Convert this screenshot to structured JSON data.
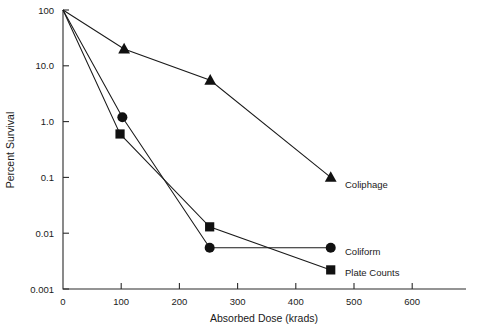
{
  "chart_data": {
    "type": "line",
    "title": "",
    "xlabel": "Absorbed Dose (krads)",
    "ylabel": "Percent Survival",
    "xlim": [
      0,
      650
    ],
    "ylim": [
      0.001,
      100
    ],
    "yscale": "log",
    "xscale": "linear",
    "grid": false,
    "legend": "inline-right",
    "xticks": [
      0,
      100,
      200,
      300,
      400,
      500,
      600
    ],
    "xtick_labels": [
      "0",
      "100",
      "200",
      "300",
      "400",
      "500",
      "600"
    ],
    "yticks": [
      100,
      10,
      1,
      0.1,
      0.01,
      0.001
    ],
    "ytick_labels": [
      "100",
      "10.0",
      "1.0",
      "0.1",
      "0.01",
      "0.001"
    ],
    "series": [
      {
        "name": "Coliphage",
        "marker": "triangle",
        "x": [
          0,
          105,
          253,
          460
        ],
        "y": [
          100,
          20,
          5.5,
          0.1
        ]
      },
      {
        "name": "Coliform",
        "marker": "circle",
        "x": [
          0,
          102,
          252,
          460
        ],
        "y": [
          100,
          1.2,
          0.0055,
          0.0055
        ]
      },
      {
        "name": "Plate Counts",
        "marker": "square",
        "x": [
          0,
          98,
          252,
          460
        ],
        "y": [
          100,
          0.6,
          0.013,
          0.0022
        ]
      }
    ]
  },
  "labels": {
    "coliphage": "Coliphage",
    "coliform": "Coliform",
    "plate_counts": "Plate Counts"
  }
}
